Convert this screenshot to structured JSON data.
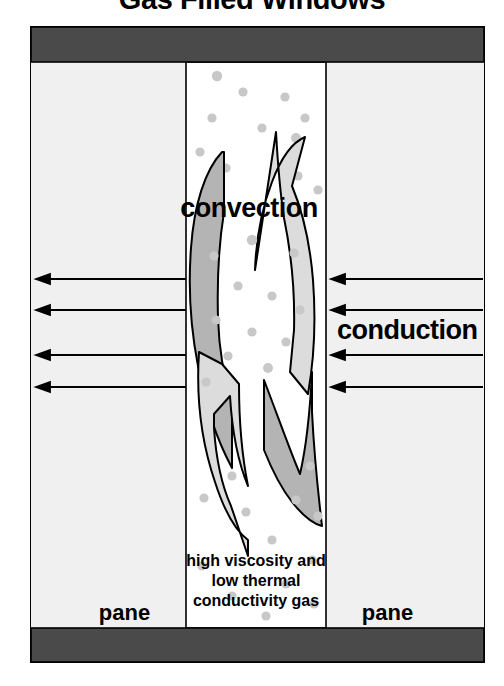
{
  "title": "Gas Filled Windows",
  "labels": {
    "convection": "convection",
    "conduction": "conduction",
    "pane_left": "pane",
    "pane_right": "pane"
  },
  "caption": {
    "line1": "high viscosity and",
    "line2": "low thermal",
    "line3": "conductivity gas"
  },
  "colors": {
    "frame_bar": "#4a4a4a",
    "pane_fill": "#f0f0f0",
    "cavity_fill": "#ffffff",
    "arrow_dark": "#b4b4b4",
    "arrow_light": "#dcdcdc",
    "molecule": "#c8c8c8",
    "outline": "#000000",
    "text": "#000000"
  },
  "diagram": {
    "frame": {
      "x": 31,
      "y": 27,
      "width": 453,
      "height": 635
    },
    "top_bar": {
      "x": 31,
      "y": 27,
      "width": 453,
      "height": 35
    },
    "bottom_bar": {
      "x": 31,
      "y": 628,
      "width": 453,
      "height": 34
    },
    "cavity": {
      "x": 186,
      "y": 62,
      "width": 140,
      "height": 566
    },
    "conduction_arrows_left": [
      {
        "y": 279,
        "x_tip": 37,
        "x_tail": 186
      },
      {
        "y": 310,
        "x_tip": 37,
        "x_tail": 186
      },
      {
        "y": 355,
        "x_tip": 37,
        "x_tail": 186
      },
      {
        "y": 387,
        "x_tip": 37,
        "x_tail": 186
      }
    ],
    "conduction_arrows_right": [
      {
        "y": 279,
        "x_tip": 332,
        "x_tail": 483
      },
      {
        "y": 310,
        "x_tip": 332,
        "x_tail": 483
      },
      {
        "y": 355,
        "x_tip": 332,
        "x_tail": 483
      },
      {
        "y": 387,
        "x_tip": 332,
        "x_tail": 483
      }
    ],
    "molecule_count": 31,
    "molecules": [
      {
        "cx": 217,
        "cy": 76,
        "r": 5.2
      },
      {
        "cx": 243,
        "cy": 92,
        "r": 4.6
      },
      {
        "cx": 285,
        "cy": 97,
        "r": 4.6
      },
      {
        "cx": 212,
        "cy": 118,
        "r": 4.6
      },
      {
        "cx": 305,
        "cy": 118,
        "r": 4.6
      },
      {
        "cx": 262,
        "cy": 128,
        "r": 4.6
      },
      {
        "cx": 296,
        "cy": 138,
        "r": 5.0
      },
      {
        "cx": 200,
        "cy": 152,
        "r": 4.6
      },
      {
        "cx": 226,
        "cy": 168,
        "r": 4.6
      },
      {
        "cx": 298,
        "cy": 176,
        "r": 4.6
      },
      {
        "cx": 318,
        "cy": 190,
        "r": 4.6
      },
      {
        "cx": 252,
        "cy": 240,
        "r": 5.2
      },
      {
        "cx": 214,
        "cy": 256,
        "r": 4.6
      },
      {
        "cx": 294,
        "cy": 253,
        "r": 4.6
      },
      {
        "cx": 238,
        "cy": 286,
        "r": 4.6
      },
      {
        "cx": 272,
        "cy": 296,
        "r": 4.6
      },
      {
        "cx": 300,
        "cy": 310,
        "r": 4.6
      },
      {
        "cx": 216,
        "cy": 320,
        "r": 4.6
      },
      {
        "cx": 252,
        "cy": 332,
        "r": 4.6
      },
      {
        "cx": 286,
        "cy": 342,
        "r": 4.6
      },
      {
        "cx": 228,
        "cy": 356,
        "r": 4.6
      },
      {
        "cx": 268,
        "cy": 368,
        "r": 5.0
      },
      {
        "cx": 206,
        "cy": 382,
        "r": 4.6
      },
      {
        "cx": 232,
        "cy": 476,
        "r": 4.6
      },
      {
        "cx": 310,
        "cy": 466,
        "r": 4.6
      },
      {
        "cx": 204,
        "cy": 498,
        "r": 4.6
      },
      {
        "cx": 296,
        "cy": 500,
        "r": 4.6
      },
      {
        "cx": 246,
        "cy": 512,
        "r": 4.6
      },
      {
        "cx": 318,
        "cy": 516,
        "r": 4.6
      },
      {
        "cx": 272,
        "cy": 540,
        "r": 4.6
      },
      {
        "cx": 312,
        "cy": 560,
        "r": 4.6
      },
      {
        "cx": 202,
        "cy": 566,
        "r": 4.6
      },
      {
        "cx": 286,
        "cy": 584,
        "r": 4.6
      },
      {
        "cx": 232,
        "cy": 596,
        "r": 4.6
      },
      {
        "cx": 314,
        "cy": 604,
        "r": 4.6
      },
      {
        "cx": 266,
        "cy": 616,
        "r": 4.6
      }
    ],
    "convection_loop": {
      "description": "two opposing crescent arrows forming a vertical circulation loop inside the gas cavity",
      "upper_left_shape": "dark crescent rising",
      "upper_right_shape": "light crescent with upward arrowhead",
      "lower_left_shape": "light crescent with downward arrowhead",
      "lower_right_shape": "dark crescent descending"
    }
  }
}
